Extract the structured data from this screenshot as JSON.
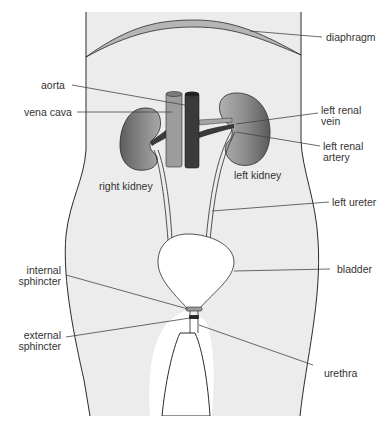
{
  "diagram": {
    "type": "anatomical-diagram",
    "colors": {
      "body_fill": "#ececec",
      "outline": "#2a2a2a",
      "diaphragm": "#b5b5b5",
      "kidney": "#8a8a8a",
      "vena_cava": "#9c9c9c",
      "aorta": "#3a3a3a",
      "bladder_fill": "#ffffff",
      "leader": "#444444",
      "label": "#333333"
    },
    "labels": {
      "diaphragm": "diaphragm",
      "aorta": "aorta",
      "vena_cava": "vena cava",
      "left_renal_vein_1": "left renal",
      "left_renal_vein_2": "vein",
      "left_renal_artery_1": "left renal",
      "left_renal_artery_2": "artery",
      "right_kidney": "right kidney",
      "left_kidney": "left kidney",
      "left_ureter": "left ureter",
      "bladder": "bladder",
      "internal_sphincter_1": "internal",
      "internal_sphincter_2": "sphincter",
      "external_sphincter_1": "external",
      "external_sphincter_2": "sphincter",
      "urethra": "urethra"
    }
  }
}
